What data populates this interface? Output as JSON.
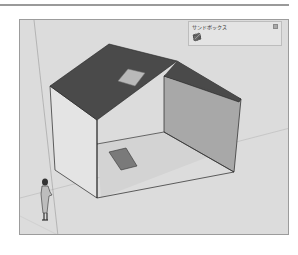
{
  "toolbar": {
    "title": "サンドボックス",
    "tools": [
      {
        "name": "from-contours"
      },
      {
        "name": "from-scratch"
      },
      {
        "name": "smoove"
      },
      {
        "name": "stamp"
      },
      {
        "name": "drape"
      },
      {
        "name": "add-detail"
      },
      {
        "name": "flip-edge"
      }
    ]
  },
  "colors": {
    "background": "#ffffff",
    "viewport": "#dcdcdc",
    "roof": "#4a4a4a",
    "front_wall": "#e6e6e6",
    "side_wall": "#b0b0b0",
    "right_wall": "#8e8e8e",
    "floor_patch": "#7a7a7a"
  }
}
